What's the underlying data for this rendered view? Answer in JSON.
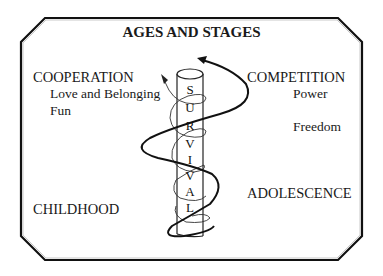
{
  "title": "AGES AND STAGES",
  "left": {
    "heading": "COOPERATION",
    "needs": [
      "Love and Belonging",
      "Fun"
    ],
    "stage": "CHILDHOOD"
  },
  "right": {
    "heading": "COMPETITION",
    "needs": [
      "Power",
      "Freedom"
    ],
    "stage": "ADOLESCENCE"
  },
  "pillar": {
    "word": "SURVIVAL",
    "letters": [
      "S",
      "U",
      "R",
      "V",
      "I",
      "V",
      "A",
      "L"
    ]
  }
}
